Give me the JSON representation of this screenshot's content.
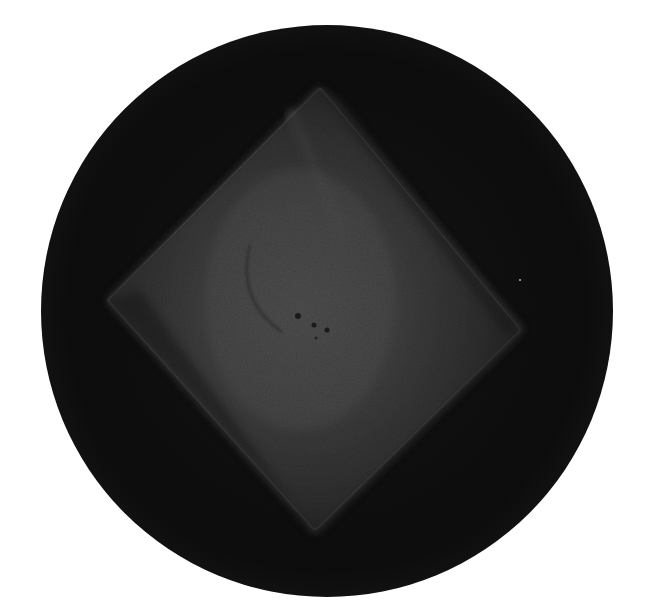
{
  "image": {
    "description": "Grayscale micrograph of a rotated square crystal inside a dark circular field of view",
    "background_color": "#ffffff",
    "field": {
      "shape": "circle",
      "cx": 327,
      "cy": 311,
      "r": 286,
      "color": "#0c0c0c"
    },
    "crystal": {
      "shape": "rotated-square",
      "vertices": [
        [
          320,
          85
        ],
        [
          525,
          330
        ],
        [
          315,
          535
        ],
        [
          105,
          300
        ]
      ],
      "outer_color": "#3a3a3a",
      "highlight_color": "#8a8a8a",
      "highlight_center": [
        300,
        300
      ]
    },
    "features": {
      "arc": {
        "path": "M 248 248 Q 238 300 280 330",
        "color": "#2e2e2e"
      },
      "dots": [
        {
          "x": 298,
          "y": 316,
          "r": 3
        },
        {
          "x": 314,
          "y": 325,
          "r": 2.5
        },
        {
          "x": 327,
          "y": 330,
          "r": 2.5
        },
        {
          "x": 316,
          "y": 338,
          "r": 1.5
        }
      ],
      "bright_speck": {
        "x": 520,
        "y": 280,
        "r": 1
      }
    }
  }
}
